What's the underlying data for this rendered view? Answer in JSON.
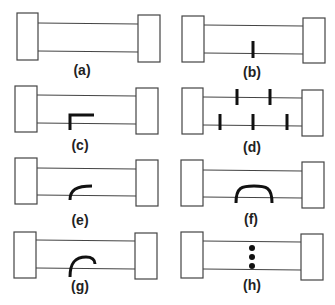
{
  "figure": {
    "panels": [
      {
        "id": "a",
        "label": "(a)",
        "defect": "none"
      },
      {
        "id": "b",
        "label": "(b)",
        "defect": "single transverse tick on lower rail"
      },
      {
        "id": "c",
        "label": "(c)",
        "defect": "L-shaped mark on lower rail"
      },
      {
        "id": "d",
        "label": "(d)",
        "defect": "two ticks on upper rail, three ticks on lower rail"
      },
      {
        "id": "e",
        "label": "(e)",
        "defect": "small curved hook on lower rail"
      },
      {
        "id": "f",
        "label": "(f)",
        "defect": "arch bridging lower rail"
      },
      {
        "id": "g",
        "label": "(g)",
        "defect": "curved hook crossing lower rail"
      },
      {
        "id": "h",
        "label": "(h)",
        "defect": "three dots between rails"
      }
    ],
    "colors": {
      "outline": "#444444",
      "mark": "#111111",
      "background": "#ffffff"
    }
  }
}
